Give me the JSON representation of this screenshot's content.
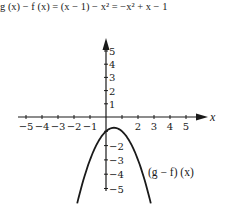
{
  "equation": {
    "text": "g (x) − f (x) = (x − 1) − x² = −x² + x − 1",
    "lhs": "g (x) − f (x)",
    "middle": "(x − 1) − x²",
    "rhs": "−x² + x − 1"
  },
  "chart_data": {
    "type": "line",
    "title": "g (x) − f (x) = (x − 1) − x² = −x² + x − 1",
    "xlabel": "x",
    "ylabel": "",
    "xlim": [
      -5.5,
      6.2
    ],
    "ylim": [
      -5.3,
      6
    ],
    "x_ticks": [
      -5,
      -4,
      -3,
      -2,
      -1,
      1,
      2,
      3,
      4,
      5
    ],
    "x_tick_labels": [
      "−5",
      "−4",
      "−3",
      "−2",
      "−1",
      "2",
      "3",
      "4",
      "5"
    ],
    "y_ticks": [
      -5,
      -4,
      -3,
      -2,
      -1,
      1,
      2,
      3,
      4,
      5
    ],
    "y_tick_labels": [
      "5",
      "4",
      "3",
      "2",
      "1",
      "−2",
      "−3",
      "−4",
      "−5"
    ],
    "grid": false,
    "series": [
      {
        "name": "(g − f) (x)",
        "function": "-x^2 + x - 1",
        "x": [
          -1.8,
          -1.5,
          -1,
          -0.5,
          0,
          0.5,
          1,
          1.5,
          2,
          2.5,
          2.8
        ],
        "values": [
          -5.04,
          -4.75,
          -3,
          -1.75,
          -1,
          -0.75,
          -1,
          -1.75,
          -3,
          -4.75,
          -5.04
        ]
      }
    ],
    "annotations": [
      "(g − f) (x)"
    ]
  },
  "axes": {
    "x_name": "x",
    "x_labels": [
      {
        "text": "−5",
        "x": -5
      },
      {
        "text": "−4",
        "x": -4
      },
      {
        "text": "−3",
        "x": -3
      },
      {
        "text": "−2",
        "x": -2
      },
      {
        "text": "−1",
        "x": -1
      },
      {
        "text": "2",
        "x": 2
      },
      {
        "text": "3",
        "x": 3
      },
      {
        "text": "4",
        "x": 4
      },
      {
        "text": "5",
        "x": 5
      }
    ],
    "y_labels": [
      {
        "text": "5",
        "y": 5
      },
      {
        "text": "4",
        "y": 4
      },
      {
        "text": "3",
        "y": 3
      },
      {
        "text": "2",
        "y": 2
      },
      {
        "text": "1",
        "y": 1
      },
      {
        "text": "−2",
        "y": -2
      },
      {
        "text": "−3",
        "y": -3
      },
      {
        "text": "−4",
        "y": -4
      },
      {
        "text": "−5",
        "y": -5
      }
    ]
  },
  "curve_label": "(g − f) (x)"
}
